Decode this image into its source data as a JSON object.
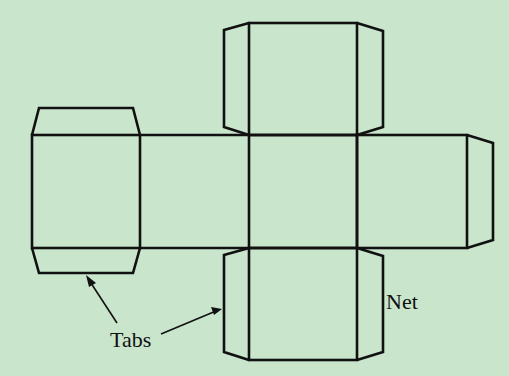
{
  "diagram": {
    "background_color": "#c9e5cc",
    "stroke_color": "#111111",
    "labels": {
      "tabs": "Tabs",
      "net": "Net"
    },
    "faces": [
      {
        "name": "top",
        "x": 249,
        "y": 23,
        "w": 108,
        "h": 112
      },
      {
        "name": "left",
        "x": 32,
        "y": 135,
        "w": 108,
        "h": 113
      },
      {
        "name": "center",
        "x": 249,
        "y": 135,
        "w": 108,
        "h": 113
      },
      {
        "name": "right",
        "x": 357,
        "y": 135,
        "w": 110,
        "h": 113
      },
      {
        "name": "bottom",
        "x": 249,
        "y": 248,
        "w": 108,
        "h": 112
      }
    ]
  }
}
